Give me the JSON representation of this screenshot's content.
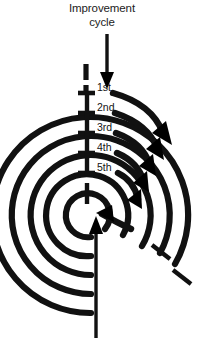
{
  "figure": {
    "type": "spiral-cycle-diagram",
    "title_lines": [
      "Improvement",
      "cycle"
    ],
    "title": "Improvement cycle",
    "caption": "",
    "stroke_color": "#111111",
    "background_color": "#ffffff",
    "ring_labels": [
      {
        "label": "1st",
        "x": 97,
        "y": 88
      },
      {
        "label": "2nd",
        "x": 97,
        "y": 108
      },
      {
        "label": "3rd",
        "x": 97,
        "y": 128
      },
      {
        "label": "4th",
        "x": 97,
        "y": 148
      },
      {
        "label": "5th",
        "x": 97,
        "y": 168
      }
    ],
    "rings": [
      {
        "name": "1st",
        "radius": 22
      },
      {
        "name": "2nd",
        "radius": 41
      },
      {
        "name": "3rd",
        "radius": 60
      },
      {
        "name": "4th",
        "radius": 79
      },
      {
        "name": "5th",
        "radius": 98
      }
    ],
    "entry_arrow": {
      "name": "top-input-arrow",
      "direction": "down"
    },
    "exit_arrow": {
      "name": "bottom-output-arrow",
      "direction": "up"
    },
    "center": {
      "x": 91,
      "y": 215
    }
  }
}
